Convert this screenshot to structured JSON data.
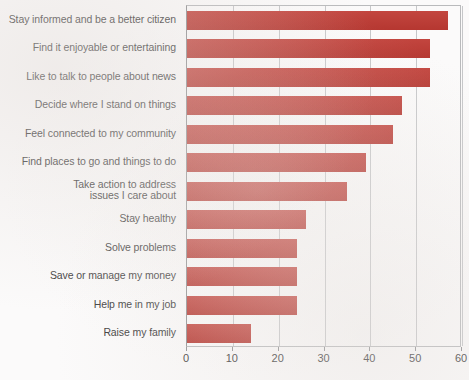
{
  "chart_data": {
    "type": "bar",
    "orientation": "horizontal",
    "title": "",
    "subtitle": "",
    "xlabel": "",
    "ylabel": "",
    "xlim": [
      0,
      60
    ],
    "ylim": null,
    "xticks": [
      "0",
      "10",
      "20",
      "30",
      "40",
      "50",
      "60"
    ],
    "xtick_values": [
      0,
      10,
      20,
      30,
      40,
      50,
      60
    ],
    "grid": "vertical",
    "legend": null,
    "legend_position": "none",
    "bar_color": "#bf3a33",
    "gridline_color": "#c6c7c9",
    "axis_color": "#8e8f91",
    "label_color": "#3b3b3b",
    "background_color": "#fbfafa",
    "categories": [
      "Stay informed and be a better citizen",
      "Find it enjoyable or entertaining",
      "Like to talk to people about news",
      "Decide where I stand on things",
      "Feel connected to my community",
      "Find places to go and things to do",
      "Take action to address\nissues I care about",
      "Stay healthy",
      "Solve problems",
      "Save or manage my money",
      "Help me in my job",
      "Raise my family"
    ],
    "values": [
      57,
      53,
      53,
      47,
      45,
      39,
      35,
      26,
      24,
      24,
      24,
      14
    ]
  }
}
